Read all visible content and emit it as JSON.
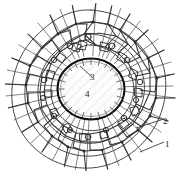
{
  "figure": {
    "type": "technical-line-diagram",
    "background_color": "#ffffff",
    "line_color": "#1a1a1a",
    "callouts": [
      {
        "id": "1",
        "label": "1",
        "x": 167,
        "y": 145,
        "leader_from_x": 140,
        "leader_from_y": 152,
        "description": "outermost sparse radial fibre zone"
      },
      {
        "id": "2",
        "label": "2",
        "x": 165,
        "y": 122,
        "leader_from_x": 136,
        "leader_from_y": 128,
        "description": "intermediate cellular network zone"
      },
      {
        "id": "3",
        "label": "3",
        "x": 93,
        "y": 78,
        "leader_from_x": 80,
        "leader_from_y": 66,
        "description": "inclusion boundary / interface shell"
      },
      {
        "id": "4",
        "label": "4",
        "x": 88,
        "y": 95,
        "leader_from_x": null,
        "leader_from_y": null,
        "description": "central circular inclusion interior"
      }
    ],
    "inclusion": {
      "center_x": 91,
      "center_y": 89,
      "radius_x": 34,
      "radius_y": 31,
      "fill": "#fdfdfd",
      "stroke_width": 2.1,
      "hatch": true
    },
    "network": {
      "outer_radius": 88,
      "cell_count_estimate": 150,
      "ring_zones": 3
    }
  }
}
